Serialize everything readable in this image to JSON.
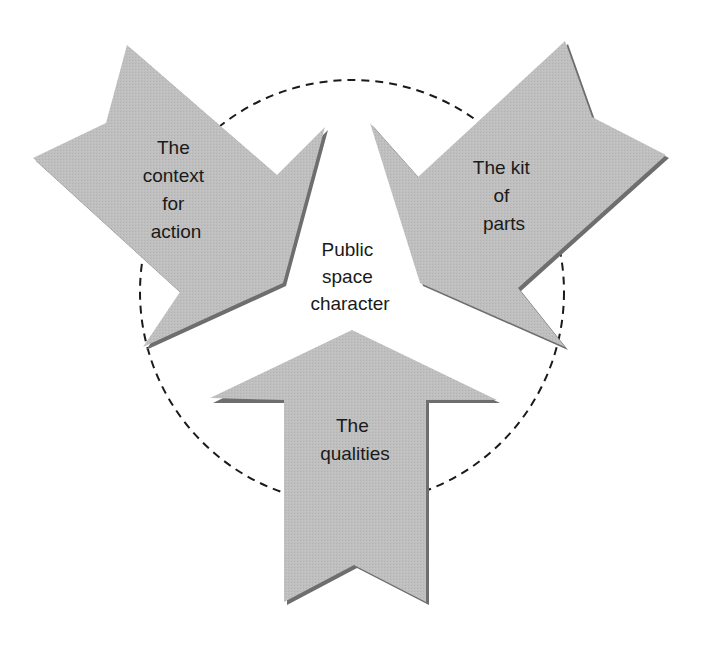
{
  "diagram": {
    "center_label": [
      "Public",
      "space",
      "character"
    ],
    "arrows": [
      {
        "id": "context",
        "label": [
          "The",
          "context",
          "for",
          "action"
        ],
        "direction": "toward-center-from-upper-left"
      },
      {
        "id": "kit",
        "label": [
          "The kit",
          "of",
          "parts"
        ],
        "direction": "toward-center-from-upper-right"
      },
      {
        "id": "qualities",
        "label": [
          "The",
          "qualities"
        ],
        "direction": "toward-center-from-below"
      }
    ],
    "colors": {
      "arrow_fill": "#bdbdbd",
      "arrow_shadow": "#6e6e6e",
      "circle_stroke": "#1a1a1a",
      "text": "#1a1a1a",
      "background": "#ffffff"
    }
  }
}
